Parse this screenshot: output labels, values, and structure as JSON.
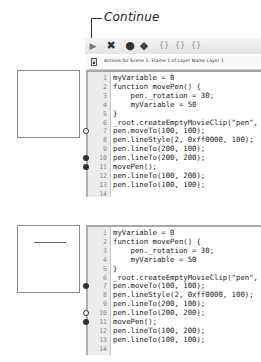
{
  "callout": {
    "label": "Continue"
  },
  "toolbar": {
    "buttons": [
      {
        "name": "continue-button",
        "icon": "play-arrow-icon",
        "glyph": "▶"
      },
      {
        "name": "stop-debugging-button",
        "icon": "close-x-icon",
        "glyph": "✖"
      },
      {
        "name": "toggle-breakpoint-button",
        "icon": "breakpoint-dot-icon",
        "glyph": "●"
      },
      {
        "name": "remove-all-breakpoints-button",
        "icon": "remove-breakpoints-icon",
        "glyph": "◆"
      },
      {
        "name": "step-over-button",
        "icon": "step-over-icon",
        "glyph": "{}"
      },
      {
        "name": "step-in-button",
        "icon": "step-in-icon",
        "glyph": "{}"
      },
      {
        "name": "step-out-button",
        "icon": "step-out-icon",
        "glyph": "{}"
      }
    ]
  },
  "actions_bar": {
    "title": "Actions for Scene 1: Frame 1 of Layer Name Layer 1"
  },
  "stages": [
    {
      "has_line": false
    },
    {
      "has_line": true
    }
  ],
  "editors": [
    {
      "lines": [
        {
          "n": "1",
          "code": "myVariable = 0",
          "bp": ""
        },
        {
          "n": "2",
          "code": "function movePen() {",
          "bp": ""
        },
        {
          "n": "3",
          "code": "    pen._rotation = 30;",
          "bp": ""
        },
        {
          "n": "4",
          "code": "    myVariable = 50",
          "bp": ""
        },
        {
          "n": "5",
          "code": "}",
          "bp": ""
        },
        {
          "n": "6",
          "code": "_root.createEmptyMovieClip(\"pen\",",
          "bp": ""
        },
        {
          "n": "7",
          "code": "pen.moveTo(100, 100);",
          "bp": "hollow"
        },
        {
          "n": "8",
          "code": "pen.lineStyle(2, 0xff0000, 100);",
          "bp": ""
        },
        {
          "n": "9",
          "code": "pen.lineTo(200, 100);",
          "bp": ""
        },
        {
          "n": "10",
          "code": "pen.lineTo(200, 200);",
          "bp": "solid"
        },
        {
          "n": "11",
          "code": "movePen();",
          "bp": "solid"
        },
        {
          "n": "12",
          "code": "pen.lineTo(100, 200);",
          "bp": ""
        },
        {
          "n": "13",
          "code": "pen.lineTo(100, 100);",
          "bp": ""
        },
        {
          "n": "14",
          "code": "",
          "bp": ""
        }
      ]
    },
    {
      "lines": [
        {
          "n": "1",
          "code": "myVariable = 0",
          "bp": ""
        },
        {
          "n": "2",
          "code": "function movePen() {",
          "bp": ""
        },
        {
          "n": "3",
          "code": "    pen._rotation = 30;",
          "bp": ""
        },
        {
          "n": "4",
          "code": "    myVariable = 50",
          "bp": ""
        },
        {
          "n": "5",
          "code": "}",
          "bp": ""
        },
        {
          "n": "6",
          "code": "_root.createEmptyMovieClip(\"pen\",",
          "bp": ""
        },
        {
          "n": "7",
          "code": "pen.moveTo(100, 100);",
          "bp": "solid"
        },
        {
          "n": "8",
          "code": "pen.lineStyle(2, 0xff0000, 100);",
          "bp": ""
        },
        {
          "n": "9",
          "code": "pen.lineTo(200, 100);",
          "bp": ""
        },
        {
          "n": "10",
          "code": "pen.lineTo(200, 200);",
          "bp": "hollow"
        },
        {
          "n": "11",
          "code": "movePen();",
          "bp": "solid"
        },
        {
          "n": "12",
          "code": "pen.lineTo(100, 200);",
          "bp": ""
        },
        {
          "n": "13",
          "code": "pen.lineTo(100, 100);",
          "bp": ""
        },
        {
          "n": "14",
          "code": "",
          "bp": ""
        }
      ]
    }
  ]
}
